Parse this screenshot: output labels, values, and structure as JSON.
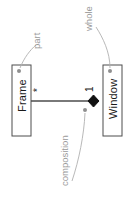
{
  "diagram": {
    "type": "uml-class-composition",
    "orientation": "rotated-90-ccw",
    "background_color": "#ffffff",
    "classes": [
      {
        "id": "frame",
        "name": "Frame",
        "role": "part",
        "multiplicity": "*"
      },
      {
        "id": "window",
        "name": "Window",
        "role": "whole",
        "multiplicity": "1"
      }
    ],
    "relationship": {
      "kind": "composition",
      "label": "composition",
      "whole_end": "window",
      "part_end": "frame",
      "whole_multiplicity": "1",
      "part_multiplicity": "*",
      "marker": "filled-diamond"
    },
    "annotations": [
      {
        "id": "part",
        "text": "part",
        "target": "frame",
        "color": "#9a9a9a"
      },
      {
        "id": "whole",
        "text": "whole",
        "target": "window",
        "color": "#9a9a9a"
      },
      {
        "id": "composition",
        "text": "composition",
        "target": "diamond",
        "color": "#9a9a9a"
      }
    ],
    "colors": {
      "box_stroke": "#4d4d4d",
      "box_fill": "#ffffff",
      "text": "#1a1a1a",
      "line": "#4d4d4d",
      "diamond": "#111111",
      "annotation": "#9a9a9a",
      "leader": "#b0b0b0"
    }
  }
}
